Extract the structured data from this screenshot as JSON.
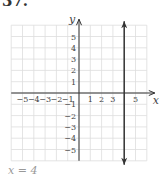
{
  "problem": {
    "number": "37."
  },
  "answer": {
    "text": "x = 4"
  },
  "chart_data": {
    "type": "line",
    "title": "",
    "xlabel": "x",
    "ylabel": "y",
    "xlim": [
      -6,
      6
    ],
    "ylim": [
      -6,
      6
    ],
    "grid": true,
    "x_ticks": [
      -5,
      -4,
      -3,
      -2,
      -1,
      1,
      2,
      3,
      5
    ],
    "y_ticks": [
      -5,
      -4,
      -3,
      -2,
      -1,
      1,
      2,
      3,
      4,
      5
    ],
    "series": [
      {
        "name": "x = 4",
        "type": "vertical-line",
        "x": 4,
        "y_range": [
          -6,
          6
        ],
        "arrows": "both",
        "color": "#333333"
      }
    ],
    "colors": {
      "grid": "#dddddd",
      "axis": "#333333",
      "line": "#333333",
      "labels": "#444444"
    }
  }
}
